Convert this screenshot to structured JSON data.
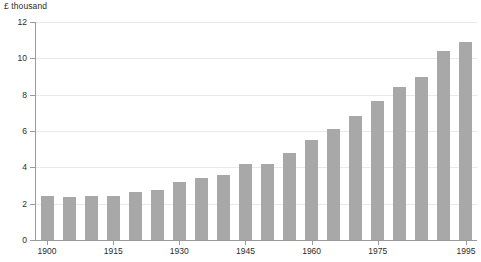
{
  "chart_data": {
    "type": "bar",
    "title": "",
    "subtitle": "",
    "axis_note": "£ thousand",
    "xlabel": "",
    "ylabel": "£ thousand",
    "ylim": [
      0,
      12
    ],
    "yticks": [
      0,
      2,
      4,
      6,
      8,
      10,
      12
    ],
    "ytick_labels": [
      "0",
      "2",
      "4",
      "6",
      "8",
      "10",
      "12"
    ],
    "grid": true,
    "legend": "none",
    "xtick_labels": [
      "1900",
      "1915",
      "1930",
      "1945",
      "1960",
      "1975",
      "1995"
    ],
    "xticks": [
      1900,
      1915,
      1930,
      1945,
      1960,
      1975,
      1995
    ],
    "categories": [
      "1900",
      "1905",
      "1910",
      "1915",
      "1920",
      "1925",
      "1930",
      "1935",
      "1940",
      "1945",
      "1950",
      "1955",
      "1960",
      "1965",
      "1970",
      "1975",
      "1980",
      "1985",
      "1990",
      "1995"
    ],
    "values": [
      2.45,
      2.35,
      2.4,
      2.4,
      2.65,
      2.75,
      3.2,
      3.4,
      3.6,
      4.2,
      4.2,
      4.8,
      5.5,
      6.1,
      6.8,
      7.65,
      8.4,
      9.0,
      10.4,
      10.9
    ],
    "bar_color": "#a8a8a8",
    "grid_color": "#e9e9e9",
    "axis_color": "#9b9b9b",
    "text_color": "#2b2b2b"
  }
}
